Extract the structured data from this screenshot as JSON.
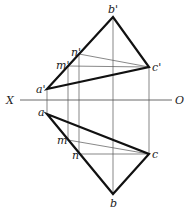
{
  "diagram": {
    "type": "orthographic-projection",
    "axis": {
      "left_label": "X",
      "right_label": "O"
    },
    "front_view": {
      "points": [
        {
          "label": "a'",
          "x": 47,
          "y": 89
        },
        {
          "label": "b'",
          "x": 113,
          "y": 17
        },
        {
          "label": "c'",
          "x": 149,
          "y": 67
        },
        {
          "label": "m'",
          "x": 68,
          "y": 66
        },
        {
          "label": "n'",
          "x": 79,
          "y": 54
        }
      ]
    },
    "top_view": {
      "points": [
        {
          "label": "a",
          "x": 47,
          "y": 114
        },
        {
          "label": "b",
          "x": 113,
          "y": 194
        },
        {
          "label": "c",
          "x": 149,
          "y": 154
        },
        {
          "label": "m",
          "x": 68,
          "y": 140
        },
        {
          "label": "n",
          "x": 79,
          "y": 154
        }
      ]
    }
  }
}
